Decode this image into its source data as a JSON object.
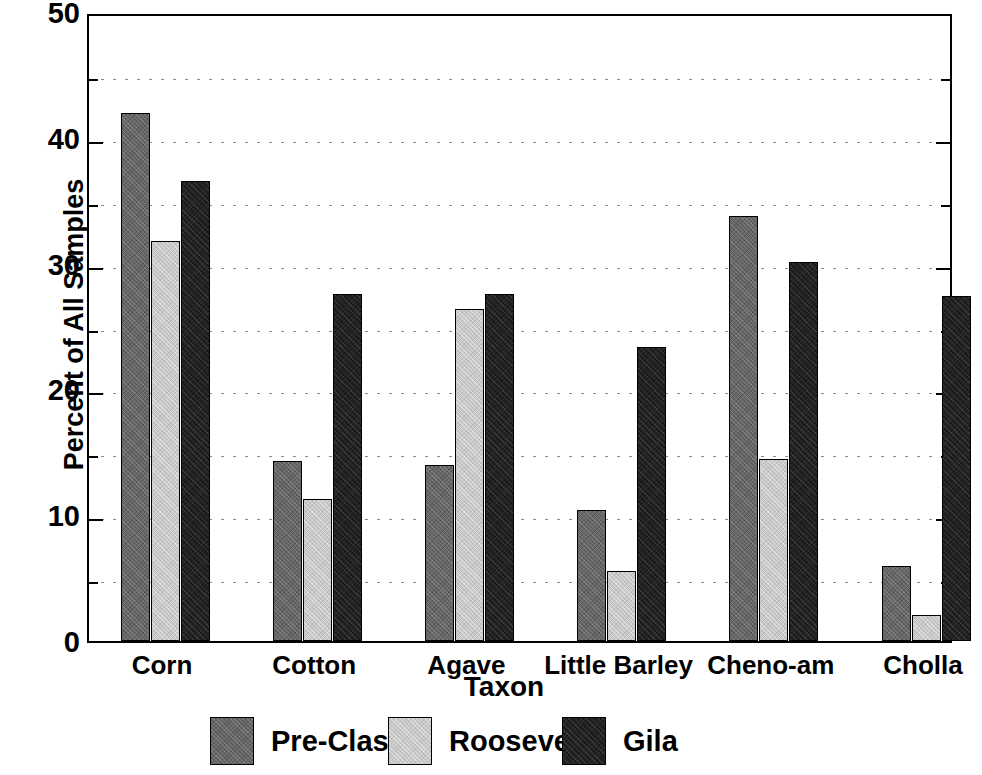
{
  "chart_data": {
    "type": "bar",
    "title": "",
    "xlabel": "Taxon",
    "ylabel": "Percent of All Samples",
    "categories": [
      "Corn",
      "Cotton",
      "Agave",
      "Little Barley",
      "Cheno-am",
      "Cholla"
    ],
    "series": [
      {
        "name": "Pre-Classic",
        "color": "#666666",
        "values": [
          42.0,
          14.3,
          14.0,
          10.4,
          33.8,
          6.0
        ]
      },
      {
        "name": "Roosevelt",
        "color": "#c8c8c8",
        "values": [
          31.8,
          11.3,
          26.4,
          5.6,
          14.5,
          2.1
        ]
      },
      {
        "name": "Gila",
        "color": "#1b1b1b",
        "values": [
          36.6,
          27.6,
          27.6,
          23.4,
          30.1,
          27.4
        ]
      }
    ],
    "ylim": [
      0,
      50
    ],
    "y_major_ticks": [
      0,
      10,
      20,
      30,
      40,
      50
    ],
    "y_minor_ticks": [
      5,
      15,
      25,
      35,
      45
    ],
    "y_tick_labels": [
      "0",
      "10",
      "20",
      "30",
      "40",
      "50"
    ],
    "grid": "horizontal-dotted-at-minor-and-major",
    "legend_position": "bottom",
    "bar_border_color": "#000000",
    "axis_color": "#000000",
    "background": "#ffffff"
  }
}
